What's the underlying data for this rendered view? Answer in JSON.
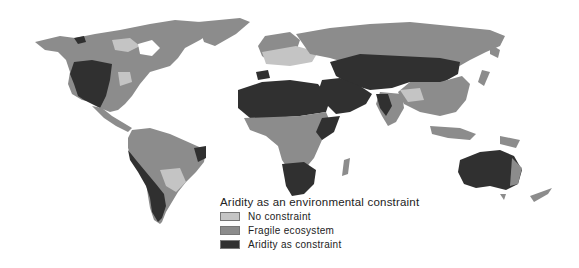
{
  "map": {
    "title": "Aridity as an environmental constraint",
    "type": "choropleth world map",
    "colors": {
      "no_constraint": "#c4c4c4",
      "fragile_ecosystem": "#8c8c8c",
      "aridity_constraint": "#303030",
      "background": "#ffffff"
    }
  },
  "legend": {
    "title": "Aridity as an environmental constraint",
    "items": [
      {
        "label": "No constraint",
        "color": "#c4c4c4"
      },
      {
        "label": "Fragile ecosystem",
        "color": "#8c8c8c"
      },
      {
        "label": "Aridity as constraint",
        "color": "#303030"
      }
    ]
  }
}
